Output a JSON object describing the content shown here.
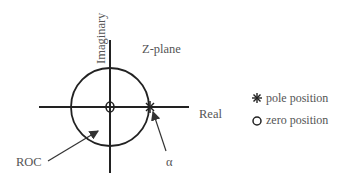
{
  "diagram": {
    "title": "Z-plane",
    "axes": {
      "vertical_label": "Imaginary",
      "horizontal_label": "Real"
    },
    "annotations": {
      "roc_label": "ROC",
      "pole_label": "α"
    },
    "legend": [
      {
        "symbol": "asterisk",
        "label": "pole position"
      },
      {
        "symbol": "circle",
        "label": "zero position"
      }
    ]
  }
}
